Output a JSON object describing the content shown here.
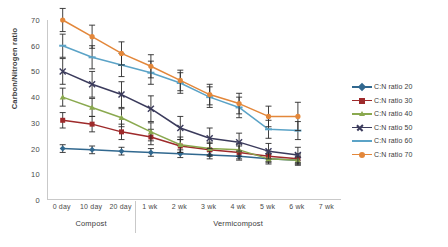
{
  "chart_data": {
    "type": "line",
    "title": "",
    "xlabel": "",
    "ylabel": "Carbon/Nitrogen ratio",
    "ylim": [
      0,
      70
    ],
    "yticks": [
      0,
      10,
      20,
      30,
      40,
      50,
      60,
      70
    ],
    "grid": false,
    "legend_position": "right",
    "error_bars": true,
    "categories": [
      "0 day",
      "10 day",
      "20 day",
      "1 wk",
      "2 wk",
      "3 wk",
      "4 wk",
      "5 wk",
      "6 wk",
      "7 wk"
    ],
    "category_groups": [
      {
        "label": "Compost",
        "categories": [
          "0 day",
          "10 day",
          "20 day"
        ]
      },
      {
        "label": "Vermicompost",
        "categories": [
          "1 wk",
          "2 wk",
          "3 wk",
          "4 wk",
          "5 wk",
          "6 wk",
          "7 wk"
        ]
      }
    ],
    "series": [
      {
        "name": "C:N ratio 20",
        "color": "#31688f",
        "marker": "diamond",
        "values": [
          20.0,
          19.5,
          19.0,
          18.5,
          18.0,
          17.5,
          17.0,
          16.0,
          15.5,
          null
        ],
        "errors": [
          1.5,
          1.5,
          1.5,
          1.5,
          1.5,
          1.5,
          1.5,
          1.5,
          1.5,
          null
        ]
      },
      {
        "name": "C:N ratio 30",
        "color": "#9e2a2b",
        "marker": "square",
        "values": [
          31.0,
          29.5,
          26.5,
          24.5,
          21.0,
          19.5,
          18.5,
          17.0,
          16.0,
          null
        ],
        "errors": [
          3.0,
          3.0,
          3.0,
          3.0,
          2.5,
          2.5,
          2.5,
          2.0,
          2.0,
          null
        ]
      },
      {
        "name": "C:N ratio 40",
        "color": "#8aa94f",
        "marker": "triangle",
        "values": [
          40.0,
          36.0,
          32.0,
          26.5,
          21.5,
          20.0,
          19.5,
          16.0,
          15.5,
          null
        ],
        "errors": [
          3.5,
          3.5,
          3.5,
          3.5,
          3.0,
          2.5,
          2.5,
          2.0,
          2.0,
          null
        ]
      },
      {
        "name": "C:N ratio 50",
        "color": "#3b3b5c",
        "marker": "x",
        "values": [
          50.0,
          45.0,
          41.0,
          35.5,
          28.0,
          24.0,
          22.5,
          19.0,
          17.5,
          null
        ],
        "errors": [
          5.0,
          5.0,
          5.0,
          5.0,
          4.5,
          4.0,
          3.5,
          3.0,
          3.0,
          null
        ]
      },
      {
        "name": "C:N ratio 60",
        "color": "#5ba3c7",
        "marker": "dash",
        "values": [
          60.0,
          55.5,
          52.5,
          49.5,
          45.5,
          40.0,
          36.0,
          27.5,
          27.0,
          null
        ],
        "errors": [
          4.5,
          4.5,
          4.5,
          4.5,
          4.0,
          4.0,
          4.0,
          3.5,
          3.5,
          null
        ]
      },
      {
        "name": "C:N ratio 70",
        "color": "#e3873a",
        "marker": "circle",
        "values": [
          70.0,
          63.5,
          57.0,
          52.0,
          46.5,
          41.0,
          37.5,
          32.5,
          32.5,
          null
        ],
        "errors": [
          4.5,
          4.5,
          4.5,
          4.5,
          4.0,
          4.0,
          4.0,
          4.0,
          5.5,
          null
        ]
      }
    ]
  }
}
